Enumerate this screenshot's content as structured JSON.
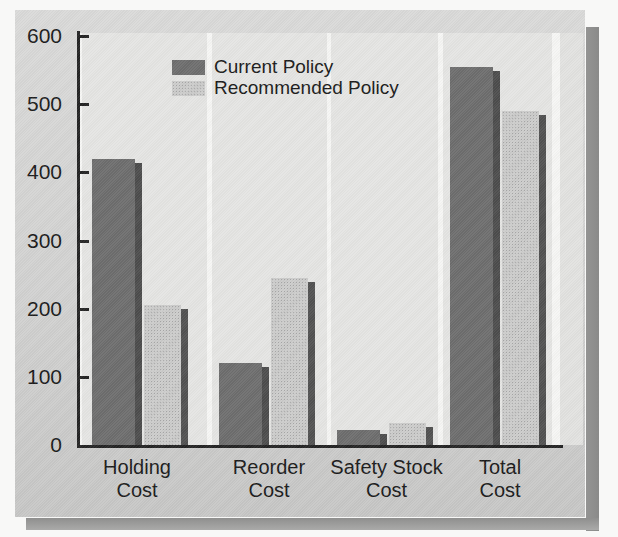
{
  "chart_data": {
    "type": "bar",
    "title": "",
    "categories": [
      "Holding Cost",
      "Reorder Cost",
      "Safety Stock Cost",
      "Total Cost"
    ],
    "category_label_lines": [
      [
        "Holding",
        "Cost"
      ],
      [
        "Reorder",
        "Cost"
      ],
      [
        "Safety Stock",
        "Cost"
      ],
      [
        "Total",
        "Cost"
      ]
    ],
    "series": [
      {
        "name": "Current Policy",
        "values": [
          420,
          120,
          22,
          555
        ],
        "color": "#6e6e6e",
        "shadow_color": "#4d4d4d",
        "pattern": "solid"
      },
      {
        "name": "Recommended Policy",
        "values": [
          205,
          245,
          33,
          490
        ],
        "color": "#cccccb",
        "shadow_color": "#525252",
        "pattern": "halftone"
      }
    ],
    "xlabel": "",
    "ylabel": "",
    "ylim": [
      0,
      600
    ],
    "yticks": [
      0,
      100,
      200,
      300,
      400,
      500,
      600
    ],
    "grid": false,
    "legend_position": "top-left-inside",
    "bar_effect": "right-side 3D extrusion shadow on every bar"
  },
  "colors": {
    "page_background": "#f8f8f7",
    "figure_background": "#d2d2d1",
    "panel_background": "#e5e5e3",
    "panel_gap_white": "#f6f6f4",
    "axis": "#242424",
    "text": "#1b1b1b",
    "figure_drop_shadow": "#8d8d8c"
  }
}
